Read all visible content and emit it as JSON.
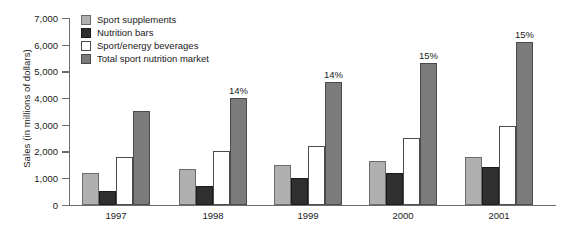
{
  "chart_data": {
    "type": "bar",
    "title": "",
    "subtitle": "",
    "xlabel": "",
    "ylabel": "Sales (in millions of dollars)",
    "categories": [
      "1997",
      "1998",
      "1999",
      "2000",
      "2001"
    ],
    "ylim": [
      0,
      7000
    ],
    "ytick_values": [
      0,
      1000,
      2000,
      3000,
      4000,
      5000,
      6000,
      7000
    ],
    "ytick_labels": [
      "0",
      "1,000",
      "2,000",
      "3,000",
      "4,000",
      "5,000",
      "6,000",
      "7,000"
    ],
    "grid": false,
    "legend_position": "top-left",
    "series": [
      {
        "name": "Sport supplements",
        "color": "#b0b0b0",
        "values": [
          1200,
          1350,
          1500,
          1650,
          1800
        ]
      },
      {
        "name": "Nutrition bars",
        "color": "#2f2f2f",
        "values": [
          500,
          700,
          1000,
          1200,
          1400
        ]
      },
      {
        "name": "Sport/energy beverages",
        "color": "#ffffff",
        "values": [
          1800,
          2000,
          2200,
          2500,
          2950
        ]
      },
      {
        "name": "Total sport nutrition market",
        "color": "#7b7b7b",
        "values": [
          3500,
          4000,
          4600,
          5300,
          6100
        ]
      }
    ],
    "annotations": [
      {
        "category": "1997",
        "series": "Total sport nutrition market",
        "text": ""
      },
      {
        "category": "1998",
        "series": "Total sport nutrition market",
        "text": "14%"
      },
      {
        "category": "1999",
        "series": "Total sport nutrition market",
        "text": "14%"
      },
      {
        "category": "2000",
        "series": "Total sport nutrition market",
        "text": "15%"
      },
      {
        "category": "2001",
        "series": "Total sport nutrition market",
        "text": "15%"
      }
    ]
  },
  "axis": {
    "y_title": "Sales (in millions of dollars)"
  },
  "legend": {
    "items": [
      {
        "label": "Sport supplements"
      },
      {
        "label": "Nutrition bars"
      },
      {
        "label": "Sport/energy beverages"
      },
      {
        "label": "Total sport nutrition market"
      }
    ]
  }
}
